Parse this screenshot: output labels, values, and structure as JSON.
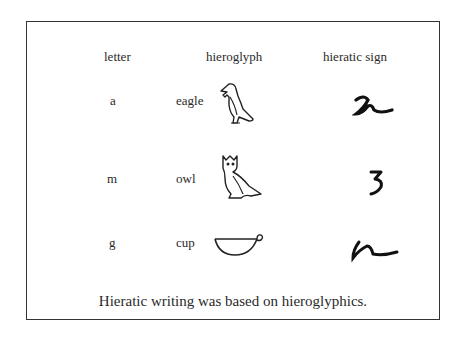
{
  "table": {
    "headers": [
      "letter",
      "hieroglyph",
      "hieratic sign"
    ],
    "rows": [
      {
        "letter": "a",
        "hieroglyph_name": "eagle",
        "hieroglyph_icon": "eagle-hieroglyph-icon",
        "hieratic_icon": "hieratic-a-icon"
      },
      {
        "letter": "m",
        "hieroglyph_name": "owl",
        "hieroglyph_icon": "owl-hieroglyph-icon",
        "hieratic_icon": "hieratic-m-icon"
      },
      {
        "letter": "g",
        "hieroglyph_name": "cup",
        "hieroglyph_icon": "cup-hieroglyph-icon",
        "hieratic_icon": "hieratic-g-icon"
      }
    ]
  },
  "caption": "Hieratic writing was based on hieroglyphics."
}
